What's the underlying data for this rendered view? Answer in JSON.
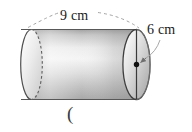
{
  "figure": {
    "name": "cylinder-diagram",
    "shape": "cylinder",
    "stray_text": "(",
    "labels": {
      "length": "9 cm",
      "diameter": "6 cm"
    },
    "annotations": {
      "length_value": 9,
      "length_unit": "cm",
      "length_line_style": "dashed-arc",
      "diameter_value": 6,
      "diameter_unit": "cm",
      "diameter_line_style": "solid-vertical-with-arrow",
      "center_marker": "dot"
    },
    "colors": {
      "outline": "#4d4d4d",
      "body_light": "#f2f2f2",
      "body_mid": "#cfcfcf",
      "body_dark": "#a8a8a8",
      "face_light": "#f5f5f5",
      "face_dark": "#b4b4b4",
      "hidden_edge": "#6a6a6a",
      "text": "#1a1a1a",
      "background": "#ffffff"
    }
  }
}
